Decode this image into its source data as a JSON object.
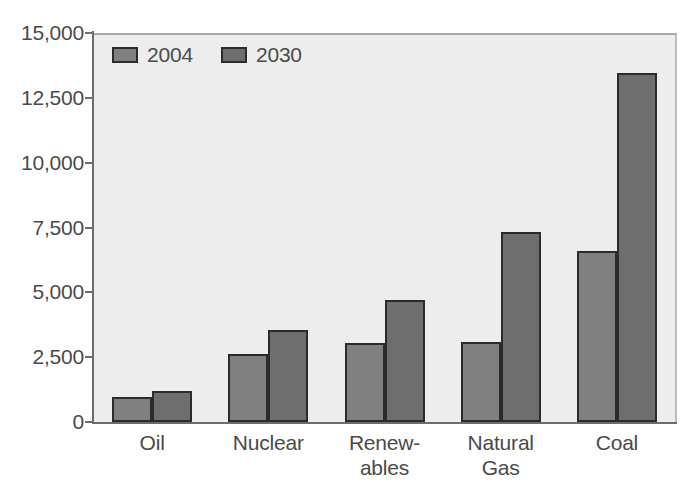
{
  "chart_data": {
    "type": "bar",
    "title": "",
    "subtitle": "",
    "xlabel": "",
    "ylabel": "",
    "categories": [
      "Oil",
      "Nuclear",
      "Renew-\nables",
      "Natural\nGas",
      "Coal"
    ],
    "category_labels_flat": [
      "Oil",
      "Nuclear",
      "Renewables",
      "Natural Gas",
      "Coal"
    ],
    "series": [
      {
        "name": "2004",
        "color": "#808080",
        "values": [
          950,
          2620,
          3050,
          3100,
          6580
        ]
      },
      {
        "name": "2030",
        "color": "#6e6e6e",
        "values": [
          1200,
          3560,
          4700,
          7320,
          13450
        ]
      }
    ],
    "ylim": [
      0,
      15000
    ],
    "ytick_values": [
      0,
      2500,
      5000,
      7500,
      10000,
      12500,
      15000
    ],
    "ytick_labels": [
      "0",
      "2,500",
      "5,000",
      "7,500",
      "10,000",
      "12,500",
      "15,000"
    ],
    "grid": false,
    "legend_position": "top-left",
    "plot_background": "#ededed",
    "axis_color": "#6d6d6d",
    "bar_outline_color": "#2b2b2b",
    "text_color": "#4a4a4a"
  }
}
